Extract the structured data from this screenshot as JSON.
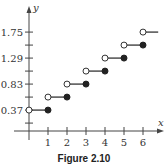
{
  "chart_data": {
    "type": "line",
    "subtype": "step",
    "title": "",
    "caption": "Figure 2.10",
    "xlabel": "x",
    "ylabel": "y",
    "x_ticks": [
      1,
      2,
      3,
      4,
      5,
      6
    ],
    "y_tick_labels": [
      "0.37",
      "0.83",
      "1.29",
      "1.75"
    ],
    "y_ticks_labeled": [
      0.37,
      0.83,
      1.29,
      1.75
    ],
    "y_ticks_all": [
      0.14,
      0.37,
      0.6,
      0.83,
      1.06,
      1.29,
      1.52,
      1.75
    ],
    "xlim": [
      -0.5,
      6.9
    ],
    "ylim": [
      0,
      1.85
    ],
    "grid": false,
    "legend": null,
    "series": [
      {
        "name": "step function",
        "segments": [
          {
            "x_start": 0,
            "x_end": 1,
            "y": 0.37,
            "start": "open",
            "end": "closed"
          },
          {
            "x_start": 1,
            "x_end": 2,
            "y": 0.6,
            "start": "open",
            "end": "closed"
          },
          {
            "x_start": 2,
            "x_end": 3,
            "y": 0.83,
            "start": "open",
            "end": "closed"
          },
          {
            "x_start": 3,
            "x_end": 4,
            "y": 1.06,
            "start": "open",
            "end": "closed"
          },
          {
            "x_start": 4,
            "x_end": 5,
            "y": 1.29,
            "start": "open",
            "end": "closed"
          },
          {
            "x_start": 5,
            "x_end": 6,
            "y": 1.52,
            "start": "open",
            "end": "closed"
          },
          {
            "x_start": 6,
            "x_end": 6.8,
            "y": 1.75,
            "start": "open",
            "end": "continues"
          }
        ]
      }
    ]
  },
  "colors": {
    "line": "#333333",
    "axis": "#444444",
    "open_fill": "#ffffff",
    "closed_fill": "#222222"
  }
}
